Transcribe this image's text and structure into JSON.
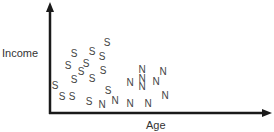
{
  "chart_data": {
    "type": "scatter",
    "title": "",
    "xlabel": "Age",
    "ylabel": "Income",
    "grid": false,
    "ticks": false,
    "legend": null,
    "axis_color": "#1a1a1a",
    "marker_color": "#444444",
    "series": [
      {
        "name": "S",
        "marker": "S",
        "points": [
          [
            107,
            43
          ],
          [
            74,
            54
          ],
          [
            92,
            52
          ],
          [
            102,
            57
          ],
          [
            68,
            66
          ],
          [
            86,
            64
          ],
          [
            81,
            72
          ],
          [
            103,
            71
          ],
          [
            74,
            80
          ],
          [
            92,
            79
          ],
          [
            55,
            86
          ],
          [
            62,
            97
          ],
          [
            72,
            97
          ],
          [
            108,
            91
          ],
          [
            89,
            102
          ]
        ]
      },
      {
        "name": "N",
        "marker": "N",
        "points": [
          [
            102,
            105
          ],
          [
            115,
            101
          ],
          [
            130,
            104
          ],
          [
            130,
            83
          ],
          [
            142,
            70
          ],
          [
            142,
            79
          ],
          [
            142,
            87
          ],
          [
            163,
            72
          ],
          [
            156,
            82
          ],
          [
            165,
            96
          ],
          [
            148,
            104
          ]
        ]
      }
    ],
    "point_coordinates": "pixel positions of marker centers in the 274x132 image"
  },
  "labels": {
    "x_axis": "Age",
    "y_axis": "Income"
  }
}
